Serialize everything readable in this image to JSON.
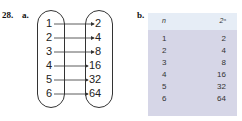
{
  "problem_number": "28.",
  "part_a": {
    "label": "a.",
    "domain": [
      "1",
      "2",
      "3",
      "4",
      "5",
      "6"
    ],
    "range": [
      "2",
      "4",
      "8",
      "16",
      "32",
      "64"
    ]
  },
  "part_b": {
    "label": "b.",
    "headers": [
      "n",
      "2ⁿ"
    ],
    "rows": [
      [
        "1",
        "2"
      ],
      [
        "2",
        "4"
      ],
      [
        "3",
        "8"
      ],
      [
        "4",
        "16"
      ],
      [
        "5",
        "32"
      ],
      [
        "6",
        "64"
      ]
    ]
  },
  "colors": {
    "table_header_bg": "#e6edf6",
    "table_body_bg": "#d6d6e7"
  }
}
